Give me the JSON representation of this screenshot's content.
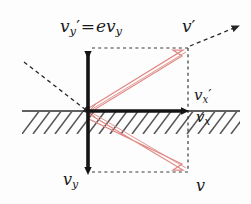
{
  "figure": {
    "colors": {
      "background": "#fdfdfd",
      "vector_black": "#141414",
      "vector_red": "#e08a86",
      "dashed_gray": "#3a3a3a",
      "hatch_gray": "#5a5a5a",
      "ground_line": "#2b2b2b"
    },
    "labels": {
      "vy_prime_eq": {
        "name": "v_y' = e v_y",
        "main": "v",
        "main_sub": "y",
        "prime": "′",
        "equals": "=",
        "rhs_coef": "e",
        "rhs_main": "v",
        "rhs_sub": "y"
      },
      "v_prime": {
        "name": "v'",
        "main": "v",
        "prime": "′"
      },
      "vx_prime": {
        "name": "v_x'",
        "main": "v",
        "sub": "x",
        "prime": "′"
      },
      "vx": {
        "name": "v_x",
        "main": "v",
        "sub": "x"
      },
      "vy": {
        "name": "v_y",
        "main": "v",
        "sub": "y"
      },
      "v": {
        "name": "v",
        "main": "v"
      }
    },
    "geometry": {
      "origin": {
        "x": 88,
        "y": 111
      },
      "corner_top_right": {
        "x": 188,
        "y": 48
      },
      "corner_bottom_right": {
        "x": 188,
        "y": 172
      },
      "vertical_arrow_top": {
        "x": 88,
        "y": 48
      },
      "vertical_arrow_bottom": {
        "x": 88,
        "y": 172
      },
      "horizontal_arrow_tip": {
        "x": 188,
        "y": 111
      },
      "ground_line_y": 111,
      "ground_line_x_start": 22,
      "ground_line_x_end": 240,
      "incoming_dashed_from": {
        "x": 24,
        "y": 62
      },
      "outgoing_dashed_to": {
        "x": 234,
        "y": 28
      }
    },
    "elements": {
      "vertical_vector": "double-headed black vertical arrow through origin",
      "horizontal_vector": "black rightward arrow along the surface",
      "red_resultant_up": "red outlined arrow from origin to top-right corner",
      "red_resultant_down": "red outlined arrow from origin to bottom-right corner",
      "dashed_box": "dashed rectangle linking vector tips to resultant corners",
      "incoming_ray": "dashed arrow approaching the surface from upper left",
      "outgoing_ray": "dashed arrow leaving the surface toward upper right",
      "hatching": "diagonal hatch marks below the surface line"
    }
  }
}
